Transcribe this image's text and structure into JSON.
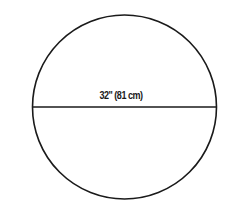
{
  "diagram": {
    "shape": "circle",
    "diameter_label": "32\" (81 cm)",
    "stroke_color": "#1a1a1a",
    "background": "#ffffff"
  }
}
